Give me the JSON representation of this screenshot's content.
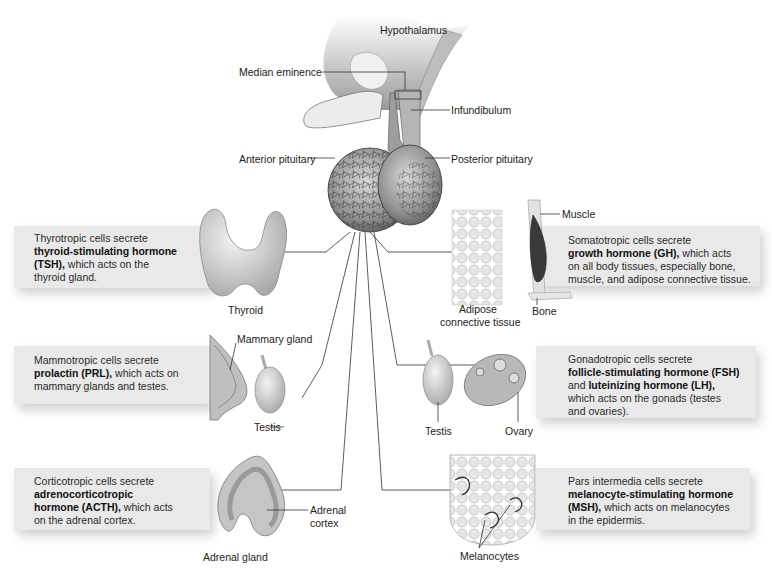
{
  "diagram": {
    "structure_labels": {
      "hypothalamus": "Hypothalamus",
      "median_eminence": "Median eminence",
      "infundibulum": "Infundibulum",
      "anterior_pituitary": "Anterior pituitary",
      "posterior_pituitary": "Posterior pituitary"
    },
    "panels": [
      {
        "id": "tsh",
        "side": "left",
        "line1": "Thyrotropic cells secrete",
        "bold": "thyroid-stimulating hormone (TSH),",
        "bold_a": "thyroid-stimulating hormone",
        "bold_b": "(TSH),",
        "rest_a": " which acts on the",
        "rest_b": "thyroid gland.",
        "organ_labels": [
          "Thyroid"
        ]
      },
      {
        "id": "prl",
        "side": "left",
        "line1": "Mammotropic cells secrete",
        "bold": "prolactin (PRL),",
        "rest_a": " which acts on",
        "rest_b": "mammary glands and testes.",
        "organ_labels": [
          "Mammary gland",
          "Testis"
        ]
      },
      {
        "id": "acth",
        "side": "left",
        "line1": "Corticotropic cells secrete",
        "bold_a": "adrenocorticotropic",
        "bold_b": "hormone (ACTH),",
        "rest_a": " which acts",
        "rest_b": "on the adrenal cortex.",
        "organ_labels": [
          "Adrenal gland",
          "Adrenal",
          "cortex"
        ]
      },
      {
        "id": "gh",
        "side": "right",
        "line1": "Somatotropic cells secrete",
        "bold": "growth hormone (GH),",
        "rest_a": " which acts",
        "rest_b": "on all body tissues, especially bone,",
        "rest_c": "muscle, and adipose connective tissue.",
        "organ_labels": [
          "Muscle",
          "Bone",
          "Adipose",
          "connective tissue"
        ]
      },
      {
        "id": "fsh_lh",
        "side": "right",
        "line1": "Gonadotropic cells secrete",
        "bold_a": "follicle-stimulating hormone (FSH)",
        "and": "and ",
        "bold_b": "luteinizing hormone (LH),",
        "rest_a": "which acts on the gonads (testes",
        "rest_b": "and ovaries).",
        "organ_labels": [
          "Testis",
          "Ovary"
        ]
      },
      {
        "id": "msh",
        "side": "right",
        "line1": "Pars intermedia cells secrete",
        "bold_a": "melanocyte-stimulating hormone",
        "bold_b": "(MSH),",
        "rest_a": " which acts on melanocytes",
        "rest_b": "in the epidermis.",
        "organ_labels": [
          "Melanocytes"
        ]
      }
    ]
  }
}
